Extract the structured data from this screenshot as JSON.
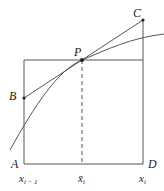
{
  "diagram": {
    "type": "geometry-figure",
    "colors": {
      "stroke": "#555555",
      "text": "#222222",
      "background": "#ffffff"
    },
    "points": {
      "A": {
        "label": "A"
      },
      "B": {
        "label": "B"
      },
      "C": {
        "label": "C"
      },
      "D": {
        "label": "D"
      },
      "P": {
        "label": "P"
      }
    },
    "axis_labels": {
      "left": {
        "base": "x",
        "sub": "i − 1"
      },
      "mid": {
        "base": "x̄",
        "sub": "i"
      },
      "right": {
        "base": "x",
        "sub": "i"
      }
    }
  }
}
